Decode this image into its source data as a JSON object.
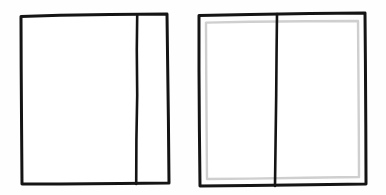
{
  "canvas": {
    "width": 386,
    "height": 195,
    "background_color": "#fefefe",
    "style": "hand-drawn line sketch"
  },
  "palette": {
    "ink_dark": "#141414",
    "ink_light": "#cfcfcf",
    "paper": "#ffffff"
  },
  "figures": [
    {
      "id": "figure-left",
      "label": "single-border rectangle with offset vertical divider",
      "outline": {
        "stroke_color": "#141414",
        "stroke_width": 3,
        "x": 20,
        "y": 14,
        "width": 149,
        "height": 170,
        "path": "M 21,16 L 167,14 L 169,183 L 22,184 Z"
      },
      "divider": {
        "id": "divider-left",
        "orientation": "vertical",
        "stroke_color": "#141414",
        "stroke_width": 2.6,
        "x_top": 137,
        "x_bottom": 136,
        "y_start": 14,
        "y_end": 184,
        "path": "M 137,15 L 136,184"
      },
      "panels": [
        {
          "id": "left-figure-panel-main",
          "label": "wide left panel",
          "x": 22,
          "y": 16,
          "width": 114,
          "height": 167
        },
        {
          "id": "left-figure-panel-side",
          "label": "narrow right panel",
          "x": 138,
          "y": 15,
          "width": 29,
          "height": 168
        }
      ]
    },
    {
      "id": "figure-right",
      "label": "double-border rectangle with centered vertical divider",
      "outline": {
        "stroke_color": "#141414",
        "stroke_width": 3,
        "x": 198,
        "y": 13,
        "width": 168,
        "height": 173,
        "path": "M 199,15 L 365,13 L 366,184 L 200,186 Z"
      },
      "inner_outline": {
        "stroke_color": "#cfcfcf",
        "stroke_width": 2.4,
        "x": 205,
        "y": 21,
        "width": 154,
        "height": 157,
        "path": "M 206,22 L 358,21 L 359,177 L 207,179 Z"
      },
      "divider": {
        "id": "divider-right",
        "orientation": "vertical",
        "stroke_color": "#141414",
        "stroke_width": 2.6,
        "x_top": 277,
        "x_bottom": 275,
        "y_start": 13,
        "y_end": 186,
        "path": "M 277,14 L 275,186"
      },
      "panels": [
        {
          "id": "right-figure-panel-left",
          "label": "left half panel",
          "x": 206,
          "y": 22,
          "width": 69,
          "height": 156
        },
        {
          "id": "right-figure-panel-right",
          "label": "right half panel",
          "x": 278,
          "y": 22,
          "width": 80,
          "height": 156
        }
      ]
    }
  ]
}
